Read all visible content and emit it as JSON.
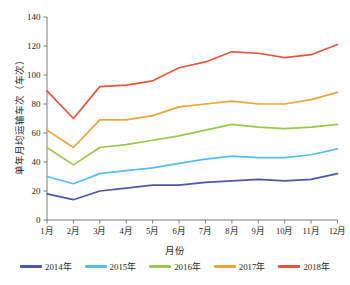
{
  "chart_data": {
    "type": "line",
    "title": "",
    "xlabel": "月份",
    "ylabel": "单年月均运输车次（车次）",
    "categories": [
      "1月",
      "2月",
      "3月",
      "4月",
      "5月",
      "6月",
      "7月",
      "8月",
      "9月",
      "10月",
      "11月",
      "12月"
    ],
    "ylim": [
      0,
      140
    ],
    "ytick_values": [
      0,
      20,
      40,
      60,
      80,
      100,
      120,
      140
    ],
    "ytick_labels": [
      "0",
      "20",
      "40",
      "60",
      "80",
      "100",
      "120",
      "140"
    ],
    "grid": false,
    "legend_position": "bottom",
    "series": [
      {
        "name": "2014年",
        "color": "#4e57a3",
        "values": [
          18,
          14,
          20,
          22,
          24,
          24,
          26,
          27,
          28,
          27,
          28,
          32
        ]
      },
      {
        "name": "2015年",
        "color": "#56bfe8",
        "values": [
          30,
          25,
          32,
          34,
          36,
          39,
          42,
          44,
          43,
          43,
          45,
          49
        ]
      },
      {
        "name": "2016年",
        "color": "#9dc74b",
        "values": [
          50,
          38,
          50,
          52,
          55,
          58,
          62,
          66,
          64,
          63,
          64,
          66
        ]
      },
      {
        "name": "2017年",
        "color": "#eda43c",
        "values": [
          62,
          50,
          69,
          69,
          72,
          78,
          80,
          82,
          80,
          80,
          83,
          88
        ]
      },
      {
        "name": "2018年",
        "color": "#e8553f",
        "values": [
          89,
          70,
          92,
          93,
          96,
          105,
          109,
          116,
          115,
          112,
          114,
          121
        ]
      }
    ]
  },
  "axis": {
    "x_axis_name": "月份",
    "y_axis_name": "单年月均运输车次（车次）"
  }
}
